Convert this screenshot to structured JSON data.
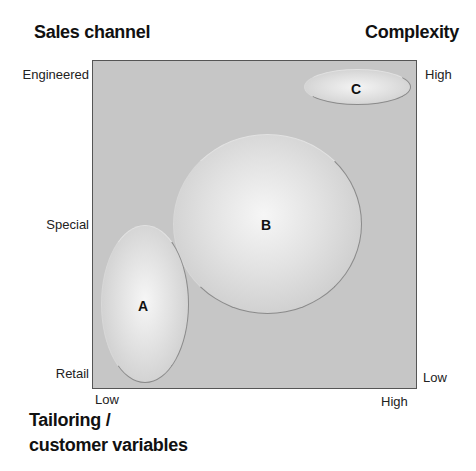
{
  "titles": {
    "y_axis_title": "Sales channel",
    "right_axis_title": "Complexity",
    "x_axis_title_line1": "Tailoring /",
    "x_axis_title_line2": "customer variables"
  },
  "y_ticks": {
    "top": "Engineered",
    "middle": "Special",
    "bottom": "Retail"
  },
  "right_ticks": {
    "top": "High",
    "bottom": "Low"
  },
  "x_ticks": {
    "left": "Low",
    "right": "High"
  },
  "regions": [
    {
      "label": "A",
      "description": "Retail / Low tailoring"
    },
    {
      "label": "B",
      "description": "Special / Medium tailoring"
    },
    {
      "label": "C",
      "description": "Engineered / High tailoring, high complexity"
    }
  ],
  "colors": {
    "plot_fill": "#c6c6c6",
    "ellipse_highlight": "#f4f4f4"
  }
}
